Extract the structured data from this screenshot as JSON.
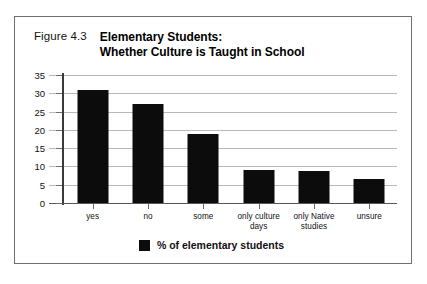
{
  "figure": {
    "number_label": "Figure 4.3",
    "title_line1": "Elementary Students:",
    "title_line2": "Whether Culture is Taught in School"
  },
  "legend": {
    "swatch_name": "black-square-swatch",
    "label": "% of elementary students"
  },
  "colors": {
    "bar": "#0c0c0c",
    "gridline": "#b9b9bb",
    "axis": "#58585b",
    "frame_border": "#6f6f72",
    "text": "#111111",
    "background": "#ffffff"
  },
  "chart_data": {
    "type": "bar",
    "title": "Elementary Students: Whether Culture is Taught in School",
    "subtitle": "Figure 4.3",
    "categories": [
      "yes",
      "no",
      "some",
      "only culture days",
      "only Native studies",
      "unsure"
    ],
    "category_lines": [
      [
        "yes"
      ],
      [
        "no"
      ],
      [
        "some"
      ],
      [
        "only culture",
        "days"
      ],
      [
        "only Native",
        "studies"
      ],
      [
        "unsure"
      ]
    ],
    "values": [
      31,
      27,
      19,
      9,
      8.7,
      6.7
    ],
    "series": [
      {
        "name": "% of elementary students",
        "values": [
          31,
          27,
          19,
          9,
          8.7,
          6.7
        ]
      }
    ],
    "xlabel": "",
    "ylabel": "",
    "ylim": [
      0,
      35
    ],
    "yticks": [
      0,
      5,
      10,
      15,
      20,
      25,
      30,
      35
    ],
    "ytick_labels": [
      "0",
      "5",
      "10",
      "15",
      "20",
      "25",
      "30",
      "35"
    ],
    "grid": true,
    "legend_position": "bottom-center"
  }
}
